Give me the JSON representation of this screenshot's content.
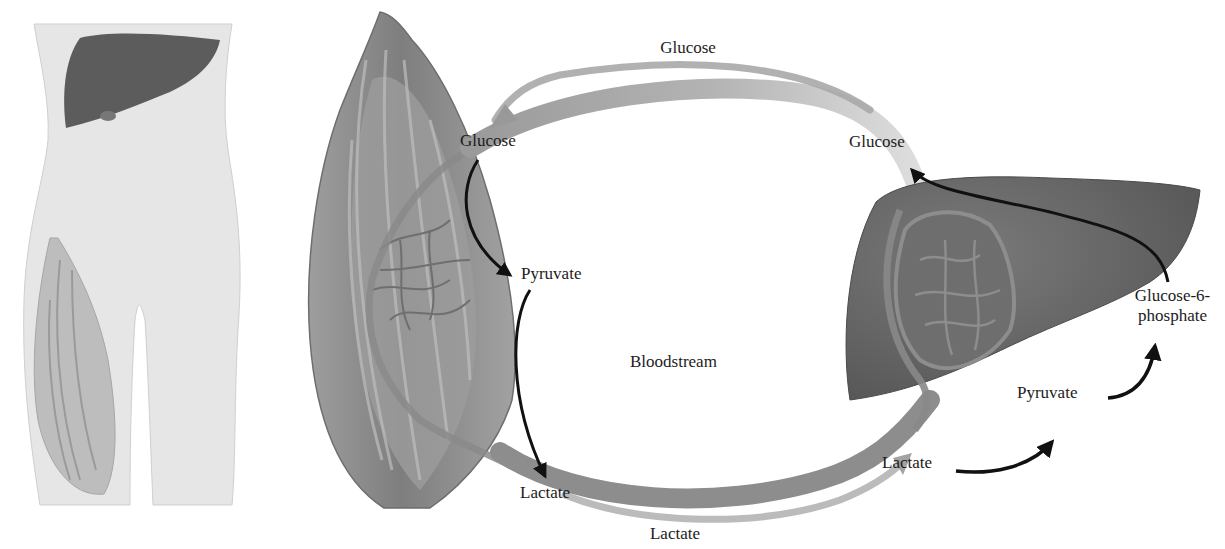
{
  "figure": {
    "panels": {
      "body_outline": {
        "organs": [
          "liver",
          "thigh-muscle"
        ]
      },
      "muscle": {
        "name": "muscle"
      },
      "liver": {
        "name": "liver"
      }
    }
  },
  "labels": {
    "glucose_top": "Glucose",
    "glucose_muscle": "Glucose",
    "glucose_liver": "Glucose",
    "pyruvate_muscle": "Pyruvate",
    "lactate_muscle": "Lactate",
    "bloodstream": "Bloodstream",
    "lactate_bottom": "Lactate",
    "lactate_liver": "Lactate",
    "pyruvate_liver": "Pyruvate",
    "g6p_line1": "Glucose-6-",
    "g6p_line2": "phosphate"
  },
  "flows": [
    {
      "from": "Glucose (liver)",
      "to": "Glucose (muscle)",
      "via": "Bloodstream"
    },
    {
      "from": "Glucose (muscle)",
      "to": "Pyruvate (muscle)"
    },
    {
      "from": "Pyruvate (muscle)",
      "to": "Lactate (muscle)"
    },
    {
      "from": "Lactate (muscle)",
      "to": "Lactate (liver)",
      "via": "Bloodstream"
    },
    {
      "from": "Lactate (liver)",
      "to": "Pyruvate (liver)"
    },
    {
      "from": "Pyruvate (liver)",
      "to": "Glucose-6-phosphate"
    },
    {
      "from": "Glucose-6-phosphate",
      "to": "Glucose (liver)"
    }
  ],
  "colors": {
    "background": "#ffffff",
    "body_skin": "#e4e4e4",
    "organ_dark": "#5a5a5a",
    "muscle_mid": "#8d8d8d",
    "vessel": "#8a8a8a",
    "flow_arrow_gray": "#a8a8a8",
    "reaction_arrow": "#111111",
    "text": "#1c1c1c"
  }
}
